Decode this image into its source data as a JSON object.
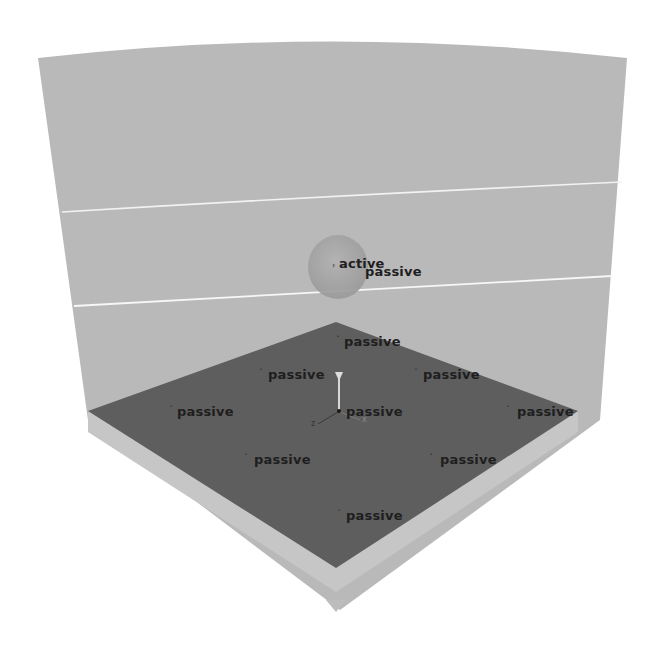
{
  "scene": {
    "background": "#ffffff",
    "colors": {
      "back_wall": "#b9b9b9",
      "floor": "#5e5e5e",
      "floor_edge": "#c4c4c4",
      "divider_line": "#f2f2f2",
      "sphere": "#a6a6a6",
      "label_text": "#1e1e1e"
    },
    "sphere_label": "active",
    "sphere_neighbor_label": "passive",
    "floor_markers": [
      {
        "label": "passive",
        "x": 336,
        "y": 336
      },
      {
        "label": "passive",
        "x": 258,
        "y": 369
      },
      {
        "label": "passive",
        "x": 413,
        "y": 369
      },
      {
        "label": "passive",
        "x": 170,
        "y": 406
      },
      {
        "label": "passive",
        "x": 335,
        "y": 406
      },
      {
        "label": "passive",
        "x": 506,
        "y": 406
      },
      {
        "label": "passive",
        "x": 244,
        "y": 454
      },
      {
        "label": "passive",
        "x": 429,
        "y": 454
      },
      {
        "label": "passive",
        "x": 336,
        "y": 510
      }
    ],
    "axis_gizmo": {
      "y_label": "y",
      "x_label": "x",
      "z_label": "z"
    }
  }
}
